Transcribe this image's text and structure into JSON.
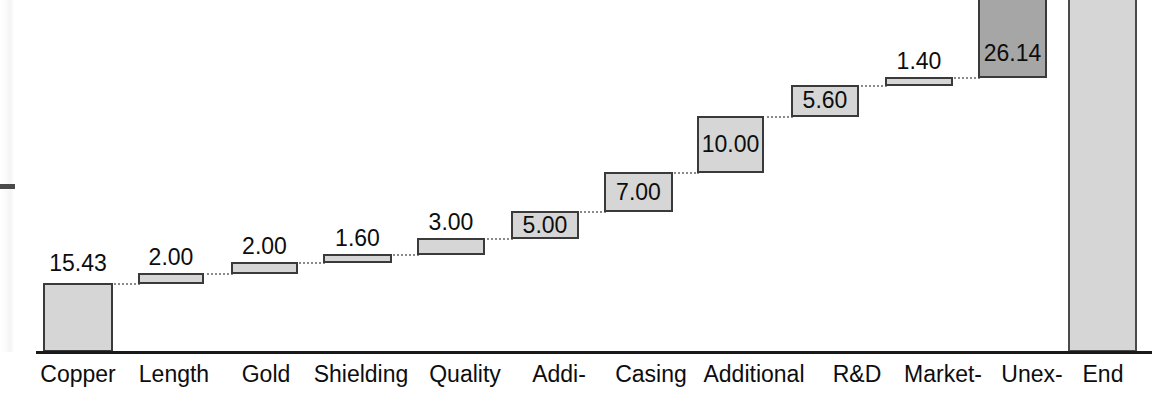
{
  "chart_data": {
    "type": "bar",
    "subtype": "waterfall",
    "title": "",
    "xlabel": "",
    "ylabel": "",
    "ylim": [
      0,
      29
    ],
    "grid": false,
    "legend": "none",
    "categories": [
      "Copper",
      "Length",
      "Gold",
      "Shielding",
      "Quality",
      "Addi-",
      "Casing",
      "Additional",
      "R&D",
      "Market-",
      "Unex-",
      "End"
    ],
    "values": [
      15.43,
      2.0,
      2.0,
      1.6,
      3.0,
      5.0,
      7.0,
      10.0,
      5.6,
      1.4,
      26.14,
      79.17
    ],
    "value_labels": [
      "15.43",
      "2.00",
      "2.00",
      "1.60",
      "3.00",
      "5.00",
      "7.00",
      "10.00",
      "5.60",
      "1.40",
      "26.14",
      ""
    ],
    "bar_kinds": [
      "base",
      "delta",
      "delta",
      "delta",
      "delta",
      "delta",
      "delta",
      "delta",
      "delta",
      "delta",
      "delta-highlight",
      "total"
    ],
    "cumulative": [
      15.43,
      17.43,
      19.43,
      21.03,
      24.03,
      29.03,
      36.03,
      46.03,
      51.63,
      53.03,
      79.17,
      79.17
    ],
    "colors": {
      "bar_fill": "#d6d6d6",
      "bar_fill_highlight": "#a6a6a6",
      "bar_border": "#3a3a3a",
      "axis": "#1a1a1a",
      "connector": "#8a8a8a",
      "text": "#0d0d0d",
      "background": "#ffffff"
    },
    "series": [
      {
        "name": "Waterfall",
        "values": [
          15.43,
          2.0,
          2.0,
          1.6,
          3.0,
          5.0,
          7.0,
          10.0,
          5.6,
          1.4,
          26.14,
          79.17
        ]
      }
    ]
  },
  "bars": [
    {
      "label": "Copper",
      "value": "15.43",
      "x": 43,
      "w": 70,
      "top": 283,
      "h": 69,
      "kind": "base",
      "label_pos": "above",
      "label_x": 43,
      "label_w": 70,
      "label_y": 252
    },
    {
      "label": "Length",
      "value": "2.00",
      "x": 138,
      "w": 66,
      "top": 273,
      "h": 11,
      "kind": "delta",
      "label_pos": "above",
      "label_x": 138,
      "label_w": 66,
      "label_y": 246
    },
    {
      "label": "Gold",
      "value": "2.00",
      "x": 231,
      "w": 67,
      "top": 262,
      "h": 12,
      "kind": "delta",
      "label_pos": "above",
      "label_x": 231,
      "label_w": 67,
      "label_y": 235
    },
    {
      "label": "Shielding",
      "value": "1.60",
      "x": 323,
      "w": 69,
      "top": 254,
      "h": 9,
      "kind": "delta",
      "label_pos": "above",
      "label_x": 323,
      "label_w": 69,
      "label_y": 227
    },
    {
      "label": "Quality",
      "value": "3.00",
      "x": 417,
      "w": 68,
      "top": 238,
      "h": 17,
      "kind": "delta",
      "label_pos": "above",
      "label_x": 417,
      "label_w": 68,
      "label_y": 211
    },
    {
      "label": "Addi-",
      "value": "5.00",
      "x": 511,
      "w": 68,
      "top": 211,
      "h": 28,
      "kind": "delta",
      "label_pos": "inside",
      "label_x": 511,
      "label_w": 68,
      "label_y": 214
    },
    {
      "label": "Casing",
      "value": "7.00",
      "x": 604,
      "w": 69,
      "top": 172,
      "h": 40,
      "kind": "delta",
      "label_pos": "inside",
      "label_x": 604,
      "label_w": 69,
      "label_y": 181
    },
    {
      "label": "Additional",
      "value": "10.00",
      "x": 697,
      "w": 67,
      "top": 116,
      "h": 57,
      "kind": "delta",
      "label_pos": "inside",
      "label_x": 697,
      "label_w": 67,
      "label_y": 133
    },
    {
      "label": "R&D",
      "value": "5.60",
      "x": 791,
      "w": 68,
      "top": 85,
      "h": 32,
      "kind": "delta",
      "label_pos": "inside",
      "label_x": 791,
      "label_w": 68,
      "label_y": 89
    },
    {
      "label": "Market-",
      "value": "1.40",
      "x": 885,
      "w": 68,
      "top": 77,
      "h": 9,
      "kind": "delta",
      "label_pos": "above",
      "label_x": 885,
      "label_w": 68,
      "label_y": 50
    },
    {
      "label": "Unex-",
      "value": "26.14",
      "x": 978,
      "w": 69,
      "top": -68,
      "h": 146,
      "kind": "delta-highlight",
      "label_pos": "inside",
      "label_x": 978,
      "label_w": 69,
      "label_y": 42
    },
    {
      "label": "End",
      "value": "",
      "x": 1068,
      "w": 69,
      "top": -8,
      "h": 360,
      "kind": "total",
      "label_pos": "none",
      "label_x": 1068,
      "label_w": 69,
      "label_y": 0
    }
  ],
  "connectors": [
    {
      "x": 111,
      "w": 29,
      "y": 283
    },
    {
      "x": 202,
      "w": 31,
      "y": 273
    },
    {
      "x": 296,
      "w": 29,
      "y": 262
    },
    {
      "x": 390,
      "w": 29,
      "y": 254
    },
    {
      "x": 483,
      "w": 30,
      "y": 238
    },
    {
      "x": 577,
      "w": 29,
      "y": 211
    },
    {
      "x": 671,
      "w": 28,
      "y": 172
    },
    {
      "x": 762,
      "w": 31,
      "y": 116
    },
    {
      "x": 857,
      "w": 30,
      "y": 85
    },
    {
      "x": 951,
      "w": 29,
      "y": 77
    },
    {
      "x": 1045,
      "w": 25,
      "y": -8
    }
  ],
  "categories": [
    {
      "label": "Copper",
      "x": 20,
      "w": 116
    },
    {
      "label": "Length",
      "x": 118,
      "w": 112
    },
    {
      "label": "Gold",
      "x": 214,
      "w": 104
    },
    {
      "label": "Shielding",
      "x": 300,
      "w": 122
    },
    {
      "label": "Quality",
      "x": 410,
      "w": 110
    },
    {
      "label": "Addi-",
      "x": 508,
      "w": 102
    },
    {
      "label": "Casing",
      "x": 596,
      "w": 110
    },
    {
      "label": "Additional",
      "x": 684,
      "w": 140
    },
    {
      "label": "R&D",
      "x": 822,
      "w": 70
    },
    {
      "label": "Market-",
      "x": 886,
      "w": 114
    },
    {
      "label": "Unex-",
      "x": 982,
      "w": 100
    },
    {
      "label": "End",
      "x": 1068,
      "w": 70
    }
  ]
}
